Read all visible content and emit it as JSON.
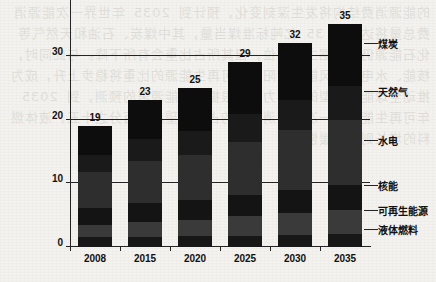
{
  "chart_data": {
    "type": "bar",
    "subtype": "stacked-bar",
    "title": "",
    "xlabel": "",
    "ylabel": "",
    "categories": [
      "2008",
      "2015",
      "2020",
      "2025",
      "2030",
      "2035"
    ],
    "totals": [
      19,
      23,
      25,
      29,
      32,
      35
    ],
    "ylim": [
      0,
      40
    ],
    "yticks": [
      0,
      10,
      20,
      30,
      40
    ],
    "ytick_labels": [
      "0",
      "10",
      "20",
      "30",
      "40"
    ],
    "grid": true,
    "grid_axis": "y",
    "legend_position": "right-inline",
    "series": [
      {
        "name": "液体燃料",
        "values": [
          1.5,
          1.6,
          1.7,
          1.8,
          1.9,
          2.0
        ],
        "color": "#171717"
      },
      {
        "name": "可再生能源",
        "values": [
          2.0,
          2.4,
          2.6,
          3.0,
          3.4,
          3.8
        ],
        "color": "#3a3a3a"
      },
      {
        "name": "核能",
        "values": [
          2.6,
          2.9,
          3.1,
          3.4,
          3.7,
          4.0
        ],
        "color": "#141414"
      },
      {
        "name": "水电",
        "values": [
          5.6,
          6.6,
          7.1,
          8.3,
          9.3,
          10.2
        ],
        "color": "#2e2e2e"
      },
      {
        "name": "天然气",
        "values": [
          2.8,
          3.4,
          3.7,
          4.3,
          4.8,
          5.3
        ],
        "color": "#1a1a1a"
      },
      {
        "name": "煤炭",
        "values": [
          4.5,
          6.1,
          6.8,
          8.2,
          8.9,
          9.7
        ],
        "color": "#0d0d0d"
      }
    ],
    "bar_value_labels": [
      "19",
      "23",
      "25",
      "29",
      "32",
      "35"
    ]
  },
  "legend": {
    "items": [
      {
        "label": "煤炭"
      },
      {
        "label": "天然气"
      },
      {
        "label": "水电"
      },
      {
        "label": "核能"
      },
      {
        "label": "可再生能源"
      },
      {
        "label": "液体燃料"
      }
    ]
  },
  "background": {
    "bleed_text": "的能源消费结构将发生深刻变化，预计到 2035 年世界一次能源消费总量将达到约 35 亿吨标准煤当量，其中煤炭、石油和天然气等化石能源仍将占据主导地位，但其所占比重会有所下降。与此同时，核能、水电以及风能、太阳能等可再生能源的比重将稳步上升，成为推动全球能源转型的重要力量。根据国际能源署的预测，到 2035 年可再生能源在一次能源消费中的占比有望超过百分之十五，液体燃料的增长则相对缓慢。"
  }
}
